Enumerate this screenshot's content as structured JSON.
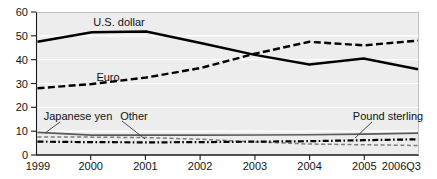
{
  "chart_data": {
    "type": "line",
    "title": "",
    "subtitle": "",
    "xlabel": "",
    "ylabel": "",
    "x": [
      "1999",
      "2000",
      "2001",
      "2002",
      "2003",
      "2004",
      "2005",
      "2006Q3"
    ],
    "xtick_labels": [
      "1999",
      "2000",
      "2001",
      "2002",
      "2003",
      "2004",
      "2005",
      "2006Q3"
    ],
    "ytick_labels": [
      "0",
      "10",
      "20",
      "30",
      "40",
      "50",
      "60"
    ],
    "ytick_values": [
      0,
      10,
      20,
      30,
      40,
      50,
      60
    ],
    "ylim": [
      0,
      60
    ],
    "grid": "horizontal-white",
    "legend_position": "inline-annotations",
    "series": [
      {
        "name": "U.S. dollar",
        "style": "solid",
        "color": "#000000",
        "label": "U.S. dollar",
        "values": [
          47.5,
          51.5,
          51.8,
          47.0,
          42.0,
          38.0,
          40.5,
          36.0
        ]
      },
      {
        "name": "Euro",
        "style": "dashed",
        "color": "#000000",
        "label": "Euro",
        "values": [
          28.0,
          29.8,
          32.5,
          36.5,
          42.5,
          47.5,
          46.0,
          48.0
        ]
      },
      {
        "name": "Japanese yen",
        "style": "solid-gray",
        "color": "#5a5a5a",
        "label": "Japanese yen",
        "values": [
          9.5,
          8.3,
          8.3,
          8.3,
          8.4,
          8.5,
          8.8,
          9.2
        ]
      },
      {
        "name": "Pound sterling",
        "style": "dash-dot",
        "color": "#000000",
        "label": "Pound sterling",
        "values": [
          5.6,
          5.4,
          5.3,
          5.4,
          5.6,
          5.8,
          6.2,
          6.6
        ]
      },
      {
        "name": "Other",
        "style": "dashed-gray",
        "color": "#7d7d7d",
        "label": "Other",
        "values": [
          7.6,
          7.5,
          7.3,
          6.6,
          5.5,
          4.6,
          4.3,
          4.0
        ]
      }
    ],
    "annotations": [
      {
        "text": "U.S. dollar",
        "for": "U.S. dollar"
      },
      {
        "text": "Euro",
        "for": "Euro"
      },
      {
        "text": "Japanese yen",
        "for": "Japanese yen"
      },
      {
        "text": "Other",
        "for": "Other"
      },
      {
        "text": "Pound sterling",
        "for": "Pound sterling"
      }
    ]
  },
  "colors": {
    "plot_background": "#ededed",
    "gridline": "#ffffff",
    "axis": "#1a1a1a",
    "page_background": "#ffffff"
  }
}
